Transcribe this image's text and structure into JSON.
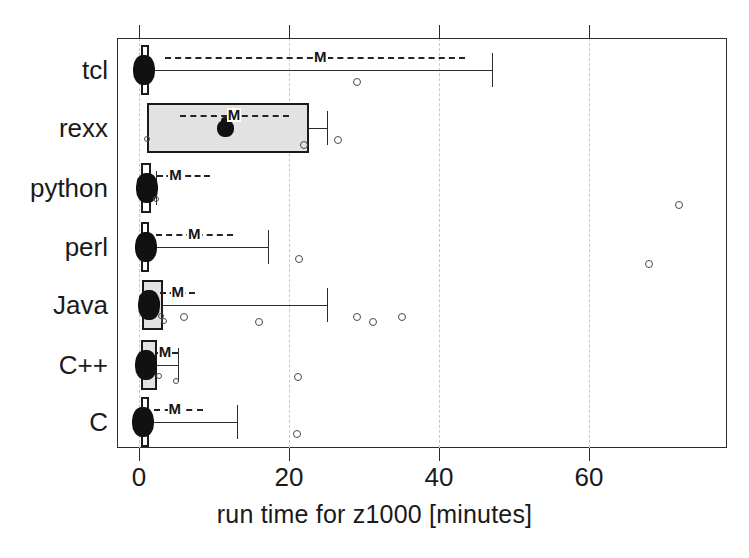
{
  "figure": {
    "background": "#ffffff",
    "frame_color": "#2b2b2b",
    "grid_color": "#c9c9c9",
    "box_fill": "#e2e2e2",
    "marker_color": "#111111"
  },
  "axis": {
    "x_title": "run time for z1000 [minutes]",
    "x_ticks": [
      "0",
      "20",
      "40",
      "60"
    ],
    "x_tick_values": [
      0,
      20,
      40,
      60
    ],
    "y_categories": [
      "tcl",
      "rexx",
      "python",
      "perl",
      "Java",
      "C++",
      "C"
    ],
    "mean_marker_label": "M"
  },
  "chart_data": {
    "type": "boxplot",
    "title": "",
    "xlabel": "run time for z1000 [minutes]",
    "ylabel": "",
    "xlim": [
      -1,
      80
    ],
    "xticks": [
      0,
      20,
      40,
      60
    ],
    "grid": "vertical dashed gridlines at x ticks",
    "legend": "none",
    "orientation": "horizontal",
    "annotations": [
      "M = mean, drawn with dashed horizontal range line"
    ],
    "categories": [
      "tcl",
      "rexx",
      "python",
      "perl",
      "Java",
      "C++",
      "C"
    ],
    "series": [
      {
        "name": "tcl",
        "q1": 0.2,
        "median": 0.6,
        "q3": 0.9,
        "whisker_low": 0.1,
        "whisker_high": 47.0,
        "mean": 24.0,
        "mean_range": [
          3.5,
          43.5
        ],
        "outliers": [
          29.0
        ],
        "dense_points": [
          0.1,
          0.3,
          0.5,
          0.7,
          0.9,
          1.0
        ]
      },
      {
        "name": "rexx",
        "q1": 1.0,
        "median": 11.5,
        "q3": 22.6,
        "whisker_low": 1.0,
        "whisker_high": 25.0,
        "mean": 12.5,
        "mean_range": [
          5.5,
          20.0
        ],
        "outliers": [
          1.2,
          22.0,
          26.5
        ],
        "dense_points": [
          11.5
        ]
      },
      {
        "name": "python",
        "q1": 0.2,
        "median": 1.1,
        "q3": 1.6,
        "whisker_low": 0.1,
        "whisker_high": 2.2,
        "mean": 4.7,
        "mean_range": [
          2.4,
          9.5
        ],
        "outliers": [
          2.4,
          72.0
        ],
        "dense_points": [
          0.3,
          0.8,
          1.2,
          1.5
        ]
      },
      {
        "name": "perl",
        "q1": 0.2,
        "median": 0.9,
        "q3": 1.2,
        "whisker_low": 0.1,
        "whisker_high": 17.2,
        "mean": 7.2,
        "mean_range": [
          2.2,
          12.5
        ],
        "outliers": [
          21.3,
          68.0
        ],
        "dense_points": [
          0.2,
          0.6,
          1.0,
          1.3
        ]
      },
      {
        "name": "Java",
        "q1": 0.4,
        "median": 1.3,
        "q3": 3.2,
        "whisker_low": 0.2,
        "whisker_high": 25.0,
        "mean": 5.0,
        "mean_range": [
          2.8,
          7.5
        ],
        "outliers": [
          3.0,
          3.4,
          6.0,
          16.0,
          29.0,
          31.2,
          35.0
        ],
        "dense_points": [
          0.5,
          1.0,
          1.4,
          1.8,
          2.2
        ]
      },
      {
        "name": "C++",
        "q1": 0.2,
        "median": 0.9,
        "q3": 2.4,
        "whisker_low": 0.1,
        "whisker_high": 5.2,
        "mean": 3.3,
        "mean_range": [
          2.4,
          5.2
        ],
        "outliers": [
          2.8,
          5.1,
          21.2
        ],
        "dense_points": [
          0.3,
          0.8,
          1.2,
          1.6
        ]
      },
      {
        "name": "C",
        "q1": 0.2,
        "median": 0.5,
        "q3": 1.0,
        "whisker_low": 0.1,
        "whisker_high": 13.0,
        "mean": 4.6,
        "mean_range": [
          2.0,
          8.5
        ],
        "outliers": [
          21.0
        ],
        "dense_points": [
          0.2,
          0.5,
          0.8
        ]
      }
    ]
  },
  "geometry": {
    "x_origin_px": 139,
    "px_per_unit": 7.5,
    "row_centers_px": [
      70,
      128,
      188,
      247,
      305,
      365,
      422
    ],
    "row_half_height_px": 28
  }
}
